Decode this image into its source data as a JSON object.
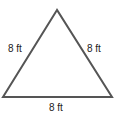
{
  "diagram": {
    "shape": "equilateral-triangle",
    "stroke_color": "#555555",
    "labels": {
      "left": "8 ft",
      "right": "8 ft",
      "bottom": "8 ft"
    }
  }
}
